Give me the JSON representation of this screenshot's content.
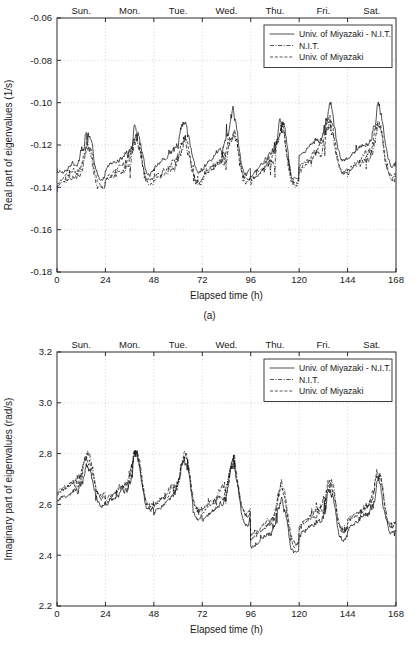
{
  "figure": {
    "panels": [
      {
        "id": "a",
        "caption": "(a)"
      },
      {
        "id": "b",
        "caption": "(b)"
      }
    ]
  },
  "legend": {
    "entries": [
      {
        "label": "Univ. of Miyazaki - N.I.T.",
        "style": "solid"
      },
      {
        "label": "N.I.T.",
        "style": "dashdot"
      },
      {
        "label": "Univ. of Miyazaki",
        "style": "dashed"
      }
    ]
  },
  "day_labels": [
    "Sun.",
    "Mon.",
    "Tue.",
    "Wed.",
    "Thu.",
    "Fri.",
    "Sat."
  ],
  "chart_data": [
    {
      "type": "line",
      "panel": "a",
      "title": "",
      "xlabel": "Elapsed time (h)",
      "ylabel": "Real part of eigenvalues (1/s)",
      "xlim": [
        0,
        168
      ],
      "ylim": [
        -0.18,
        -0.06
      ],
      "xticks": [
        0,
        24,
        48,
        72,
        96,
        120,
        144,
        168
      ],
      "xticklabels": [
        "0",
        "24",
        "48",
        "72",
        "96",
        "120",
        "144",
        "168"
      ],
      "yticks": [
        -0.06,
        -0.08,
        -0.1,
        -0.12,
        -0.14,
        -0.16,
        -0.18
      ],
      "yticklabels": [
        "-0.06",
        "-0.08",
        "-0.10",
        "-0.12",
        "-0.14",
        "-0.16",
        "-0.18"
      ],
      "top_axis_labels": [
        "Sun.",
        "Mon.",
        "Tue.",
        "Wed.",
        "Thu.",
        "Fri.",
        "Sat."
      ],
      "top_axis_ticks": [
        24,
        48,
        72,
        96,
        120,
        144
      ],
      "grid": true,
      "legend_position": "top-right",
      "series": [
        {
          "name": "Univ. of Miyazaki - N.I.T.",
          "style": "solid",
          "daily_baseline": [
            -0.1295,
            -0.127,
            -0.1255,
            -0.125,
            -0.1285,
            -0.12,
            -0.121
          ],
          "daily_amplitude": [
            0.0145,
            0.015,
            0.016,
            0.0195,
            0.0215,
            0.018,
            0.0185
          ],
          "noise": 0.0042,
          "peak_values": [
            -0.1015,
            -0.098,
            -0.0955,
            -0.0862,
            -0.0805,
            -0.0905,
            -0.09
          ],
          "trough_values": [
            -0.142,
            -0.1405,
            -0.14,
            -0.1395,
            -0.136,
            -0.133,
            -0.1385
          ]
        },
        {
          "name": "N.I.T.",
          "style": "dashdot",
          "daily_baseline": [
            -0.1355,
            -0.133,
            -0.132,
            -0.1305,
            -0.132,
            -0.1265,
            -0.1285
          ],
          "daily_amplitude": [
            0.0135,
            0.014,
            0.0148,
            0.0165,
            0.0185,
            0.016,
            0.0165
          ],
          "noise": 0.0048,
          "peak_values": [
            -0.109,
            -0.106,
            -0.104,
            -0.1045,
            -0.1,
            -0.101,
            -0.1005
          ],
          "trough_values": [
            -0.1595,
            -0.151,
            -0.1465,
            -0.1455,
            -0.143,
            -0.14,
            -0.147
          ]
        },
        {
          "name": "Univ. of Miyazaki",
          "style": "dashed",
          "daily_baseline": [
            -0.134,
            -0.1315,
            -0.1305,
            -0.1292,
            -0.1308,
            -0.125,
            -0.1272
          ],
          "daily_amplitude": [
            0.0138,
            0.0142,
            0.015,
            0.017,
            0.019,
            0.0165,
            0.017
          ],
          "noise": 0.0045,
          "peak_values": [
            -0.1075,
            -0.1045,
            -0.103,
            -0.103,
            -0.0985,
            -0.0995,
            -0.099
          ],
          "trough_values": [
            -0.156,
            -0.149,
            -0.145,
            -0.144,
            -0.1415,
            -0.1385,
            -0.1455
          ]
        }
      ]
    },
    {
      "type": "line",
      "panel": "b",
      "title": "",
      "xlabel": "Elapsed time (h)",
      "ylabel": "Imaginary part of eigenvalues (rad/s)",
      "xlim": [
        0,
        168
      ],
      "ylim": [
        2.2,
        3.2
      ],
      "xticks": [
        0,
        24,
        48,
        72,
        96,
        120,
        144,
        168
      ],
      "xticklabels": [
        "0",
        "24",
        "48",
        "72",
        "96",
        "120",
        "144",
        "168"
      ],
      "yticks": [
        2.2,
        2.4,
        2.6,
        2.8,
        3.0,
        3.2
      ],
      "yticklabels": [
        "2.2",
        "2.4",
        "2.6",
        "2.8",
        "3.0",
        "3.2"
      ],
      "top_axis_labels": [
        "Sun.",
        "Mon.",
        "Tue.",
        "Wed.",
        "Thu.",
        "Fri.",
        "Sat."
      ],
      "top_axis_ticks": [
        24,
        48,
        72,
        96,
        120,
        144
      ],
      "grid": true,
      "legend_position": "top-right",
      "series": [
        {
          "name": "Univ. of Miyazaki - N.I.T.",
          "style": "solid",
          "daily_baseline": [
            2.645,
            2.64,
            2.615,
            2.58,
            2.47,
            2.52,
            2.545
          ],
          "daily_amplitude": [
            0.105,
            0.145,
            0.155,
            0.145,
            0.145,
            0.13,
            0.13
          ],
          "noise": 0.035,
          "peak_values": [
            2.8,
            2.92,
            2.905,
            2.81,
            2.815,
            2.82,
            2.79
          ],
          "trough_values": [
            2.495,
            2.43,
            2.35,
            2.27,
            2.205,
            2.33,
            2.33
          ]
        },
        {
          "name": "N.I.T.",
          "style": "dashdot",
          "daily_baseline": [
            2.68,
            2.66,
            2.645,
            2.625,
            2.515,
            2.555,
            2.58
          ],
          "daily_amplitude": [
            0.11,
            0.15,
            0.16,
            0.155,
            0.15,
            0.135,
            0.14
          ],
          "noise": 0.038,
          "peak_values": [
            2.88,
            2.945,
            2.92,
            2.88,
            2.855,
            2.815,
            2.835
          ],
          "trough_values": [
            2.545,
            2.47,
            2.395,
            2.33,
            2.29,
            2.37,
            2.38
          ]
        },
        {
          "name": "Univ. of Miyazaki",
          "style": "dashed",
          "daily_baseline": [
            2.672,
            2.652,
            2.638,
            2.615,
            2.505,
            2.548,
            2.572
          ],
          "daily_amplitude": [
            0.108,
            0.148,
            0.158,
            0.152,
            0.148,
            0.133,
            0.138
          ],
          "noise": 0.037,
          "peak_values": [
            2.87,
            2.938,
            2.915,
            2.872,
            2.848,
            2.808,
            2.828
          ],
          "trough_values": [
            2.535,
            2.462,
            2.388,
            2.322,
            2.282,
            2.362,
            2.372
          ]
        }
      ]
    }
  ]
}
